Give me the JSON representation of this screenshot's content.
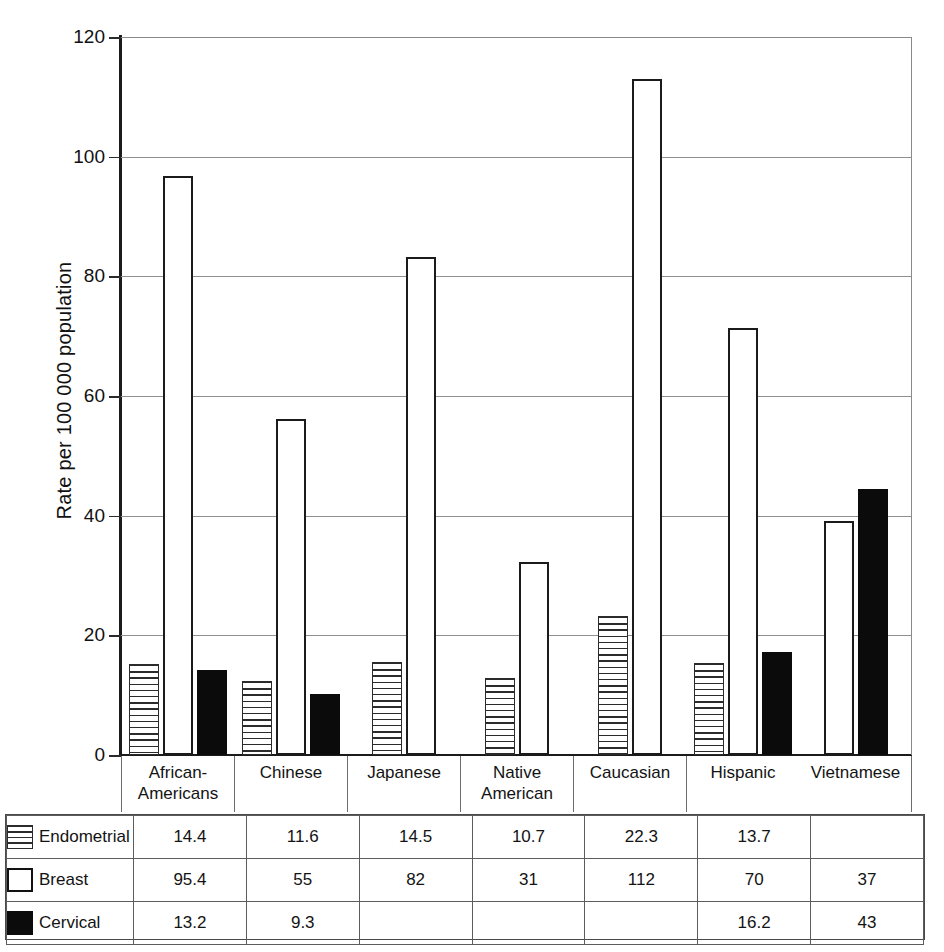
{
  "chart_data": {
    "type": "bar",
    "title": "",
    "xlabel": "",
    "ylabel": "Rate per 100 000 population",
    "ylim": [
      0,
      120
    ],
    "yticks": [
      0,
      20,
      40,
      60,
      80,
      100,
      120
    ],
    "grid": true,
    "legend_position": "table-below",
    "categories": [
      "African-Americans",
      "Chinese",
      "Japanese",
      "Native American",
      "Caucasian",
      "Hispanic",
      "Vietnamese"
    ],
    "series": [
      {
        "name": "Endometrial",
        "swatch": "horizontal-stripes",
        "values": [
          14.4,
          11.6,
          14.5,
          10.7,
          22.3,
          13.7,
          null
        ],
        "labels": [
          "14.4",
          "11.6",
          "14.5",
          "10.7",
          "22.3",
          "13.7",
          ""
        ]
      },
      {
        "name": "Breast",
        "swatch": "white-outline",
        "values": [
          95.4,
          55,
          82,
          31,
          112,
          70,
          37
        ],
        "labels": [
          "95.4",
          "55",
          "82",
          "31",
          "112",
          "70",
          "37"
        ]
      },
      {
        "name": "Cervical",
        "swatch": "solid-black",
        "values": [
          13.2,
          9.3,
          null,
          null,
          null,
          16.2,
          43
        ],
        "labels": [
          "13.2",
          "9.3",
          "",
          "",
          "",
          "16.2",
          "43"
        ]
      }
    ],
    "bar_plotted_heights": {
      "Endometrial": [
        15.2,
        12.3,
        15.6,
        12.9,
        23.2,
        15.4,
        null
      ],
      "Breast": [
        96.8,
        56.2,
        83.2,
        32.3,
        113.0,
        71.3,
        39.1
      ],
      "Cervical": [
        14.2,
        10.2,
        null,
        null,
        null,
        17.2,
        44.4
      ]
    }
  },
  "axis": {
    "y_title": "Rate per 100 000 population",
    "ytick_labels": [
      "0",
      "20",
      "40",
      "60",
      "80",
      "100",
      "120"
    ]
  },
  "table": {
    "column_headers": [
      "African-Americans",
      "Chinese",
      "Japanese",
      "Native American",
      "Caucasian",
      "Hispanic",
      "Vietnamese"
    ],
    "rows": [
      {
        "label": "Endometrial",
        "swatch": "endometrial",
        "cells": [
          "14.4",
          "11.6",
          "14.5",
          "10.7",
          "22.3",
          "13.7",
          ""
        ]
      },
      {
        "label": "Breast",
        "swatch": "breast",
        "cells": [
          "95.4",
          "55",
          "82",
          "31",
          "112",
          "70",
          "37"
        ]
      },
      {
        "label": "Cervical",
        "swatch": "cervical",
        "cells": [
          "13.2",
          "9.3",
          "",
          "",
          "",
          "16.2",
          "43"
        ]
      }
    ]
  },
  "colors": {
    "background": "#ffffff",
    "axis": "#1b1b1b",
    "gridline": "#909090",
    "bar_outline": "#1b1b1b",
    "cervical_fill": "#0b0b0b",
    "table_border": "#5c5c5c"
  }
}
